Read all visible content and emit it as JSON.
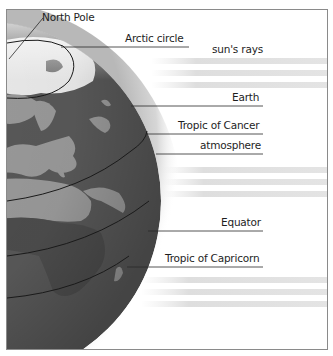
{
  "diagram": {
    "title": "",
    "labels": {
      "north_pole": "North Pole",
      "arctic_circle": "Arctic circle",
      "suns_rays": "sun's rays",
      "earth": "Earth",
      "tropic_of_cancer": "Tropic of Cancer",
      "atmosphere": "atmosphere",
      "equator": "Equator",
      "tropic_of_capricorn": "Tropic of Capricorn"
    },
    "colors": {
      "ocean": "#5a5a5a",
      "land": "#9a9a9a",
      "ice": "#f0f0f0",
      "atmosphere": "#d8d8d8",
      "rays": "#e2e2e2",
      "lines": "#1a1a1a",
      "frame": "#8a8a8a"
    }
  }
}
